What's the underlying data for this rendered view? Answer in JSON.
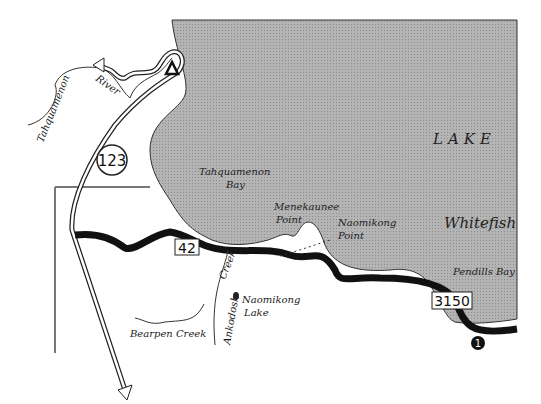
{
  "map": {
    "colors": {
      "water": "#a8a8a8",
      "land": "#ffffff",
      "road": "#111111",
      "line": "#222222"
    },
    "labels": {
      "lake": "LAKE",
      "whitefish": "Whitefish",
      "tahquamenon_bay_1": "Tahquamenon",
      "tahquamenon_bay_2": "Bay",
      "menekaunee_1": "Menekaunee",
      "menekaunee_2": "Point",
      "naomikong_point_1": "Naomikong",
      "naomikong_point_2": "Point",
      "pendills_bay": "Pendills Bay",
      "naomikong_lake_1": "Naomikong",
      "naomikong_lake_2": "Lake",
      "bearpen_creek": "Bearpen Creek",
      "ankodosh_creek_1": "Ankodosh",
      "ankodosh_creek_2": "Creek",
      "tahquamenon_river_1": "Tahquamenon",
      "tahquamenon_river_2": "River"
    },
    "routes": {
      "m123": "123",
      "h42": "42",
      "fr3150": "3150"
    },
    "markers": {
      "point1": "1",
      "campground": "campground-triangle"
    }
  }
}
